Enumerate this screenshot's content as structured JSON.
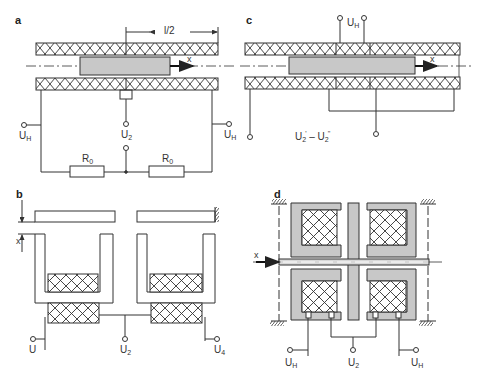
{
  "figure": {
    "panels": [
      {
        "id": "a",
        "letter": "a"
      },
      {
        "id": "b",
        "letter": "b"
      },
      {
        "id": "c",
        "letter": "c"
      },
      {
        "id": "d",
        "letter": "d"
      }
    ]
  },
  "colors": {
    "line": "#333333",
    "core_fill": "#c8c8c8",
    "background": "#ffffff"
  },
  "panel_a": {
    "letter": "a",
    "dimension_label": "l/2",
    "axis_label": "x",
    "terminal_left": {
      "main": "U",
      "sub": "H"
    },
    "terminal_right": {
      "main": "U",
      "sub": "H"
    },
    "terminal_center": {
      "main": "U",
      "sub": "2"
    },
    "resistor_left": {
      "main": "R",
      "sub": "0"
    },
    "resistor_right": {
      "main": "R",
      "sub": "0"
    }
  },
  "panel_b": {
    "letter": "b",
    "axis_label": "x",
    "terminal_left": {
      "main": "U",
      "sub": ""
    },
    "terminal_center": {
      "main": "U",
      "sub": "2"
    },
    "terminal_right": {
      "main": "U",
      "sub": "4"
    }
  },
  "panel_c": {
    "letter": "c",
    "axis_label": "x",
    "terminal_top": {
      "main": "U",
      "sub": "H"
    },
    "output_label": {
      "a_main": "U",
      "a_sub": "2",
      "a_sup": "'",
      "sep": " – ",
      "b_main": "U",
      "b_sub": "2",
      "b_sup": "''"
    }
  },
  "panel_d": {
    "letter": "d",
    "axis_label": "x",
    "terminal_left": {
      "main": "U",
      "sub": "H"
    },
    "terminal_center": {
      "main": "U",
      "sub": "2"
    },
    "terminal_right": {
      "main": "U",
      "sub": "H"
    }
  }
}
